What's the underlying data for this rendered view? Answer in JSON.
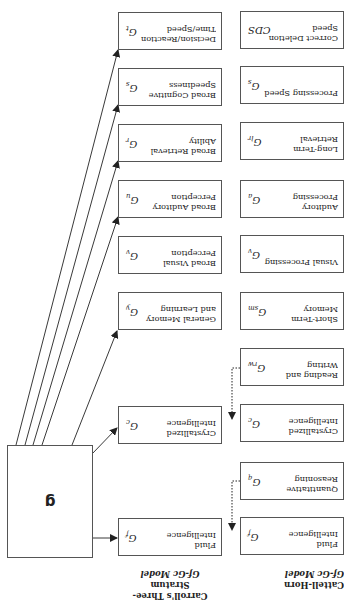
{
  "diagram": {
    "general_factor": "g",
    "carroll": {
      "heading_line1": "Carroll's Three-Stratum",
      "heading_line2": "Gf-Gc Model",
      "boxes": [
        {
          "label": "Fluid\nIntelligence",
          "symbol": "G",
          "sub": "f"
        },
        {
          "label": "Crystallized\nIntelligence",
          "symbol": "G",
          "sub": "c"
        },
        {
          "label": "General Memory\nand Learning",
          "symbol": "G",
          "sub": "y"
        },
        {
          "label": "Broad Visual\nPerception",
          "symbol": "G",
          "sub": "v"
        },
        {
          "label": "Broad Auditory\nPerception",
          "symbol": "G",
          "sub": "u"
        },
        {
          "label": "Broad Retrieval\nAbility",
          "symbol": "G",
          "sub": "r"
        },
        {
          "label": "Broad Cognitive\nSpeediness",
          "symbol": "G",
          "sub": "s"
        },
        {
          "label": "Decision/Reaction\nTime/Speed",
          "symbol": "G",
          "sub": "t"
        }
      ]
    },
    "cattell_horn": {
      "heading_line1": "Cattell-Horn",
      "heading_line2": "Gf-Gc Model",
      "boxes": [
        {
          "label": "Fluid\nIntelligence",
          "symbol": "G",
          "sub": "f"
        },
        {
          "label": "Quantitative\nReasoning",
          "symbol": "G",
          "sub": "q"
        },
        {
          "label": "Crystallized\nIntelligence",
          "symbol": "G",
          "sub": "c"
        },
        {
          "label": "Reading and\nWriting",
          "symbol": "G",
          "sub": "rw"
        },
        {
          "label": "Short-Term\nMemory",
          "symbol": "G",
          "sub": "sm"
        },
        {
          "label": "Visual Processing",
          "symbol": "G",
          "sub": "v"
        },
        {
          "label": "Auditory\nProcessing",
          "symbol": "G",
          "sub": "a"
        },
        {
          "label": "Long-Term\nRetrieval",
          "symbol": "G",
          "sub": "lr"
        },
        {
          "label": "Processing Speed",
          "symbol": "G",
          "sub": "s"
        },
        {
          "label": "Correct Deletion\nSpeed",
          "symbol": "CDS",
          "sub": ""
        }
      ]
    }
  }
}
